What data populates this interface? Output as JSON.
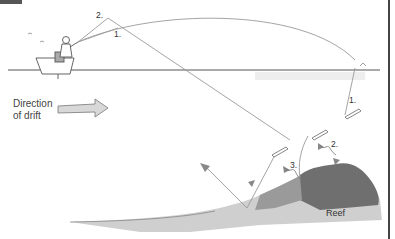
{
  "figure": {
    "badge_color": "#555555",
    "labels": {
      "step1_upper": "1.",
      "step2_upper": "2.",
      "step1_right": "1.",
      "step2_reef": "2.",
      "step3_reef": "3.",
      "drift_line1": "Direction",
      "drift_line2": "of drift",
      "reef": "Reef"
    },
    "colors": {
      "line": "#888888",
      "water_surface": "#555555",
      "reef_dark": "#6b6b6b",
      "reef_light": "#bdbdbd",
      "arrow_fill": "#d8d8d8"
    }
  }
}
